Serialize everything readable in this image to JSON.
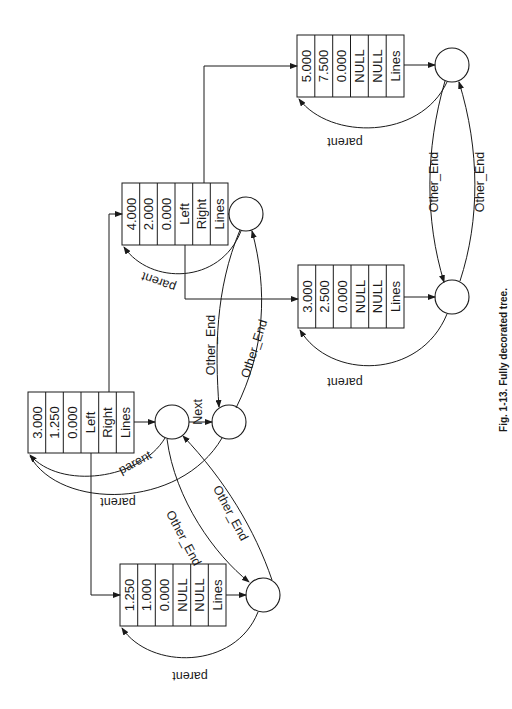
{
  "caption": "Fig. 1-13. Fully decorated tree.",
  "colors": {
    "ink": "#1a1a1a",
    "background": "#ffffff"
  },
  "nodes": {
    "root": {
      "cells": [
        "3.000",
        "1.250",
        "0.000",
        "Left",
        "Right",
        "Lines"
      ]
    },
    "right_child": {
      "cells": [
        "4.000",
        "2.000",
        "0.000",
        "Left",
        "Right",
        "Lines"
      ]
    },
    "left_child": {
      "cells": [
        "1.250",
        "1.000",
        "0.000",
        "NULL",
        "NULL",
        "Lines"
      ]
    },
    "right_left_leaf": {
      "cells": [
        "3.000",
        "2.500",
        "0.000",
        "NULL",
        "NULL",
        "Lines"
      ]
    },
    "right_right_leaf": {
      "cells": [
        "5.000",
        "7.500",
        "0.000",
        "NULL",
        "NULL",
        "Lines"
      ]
    }
  },
  "edge_labels": {
    "parent": "parent",
    "next": "Next",
    "other_end": "Other_End"
  }
}
